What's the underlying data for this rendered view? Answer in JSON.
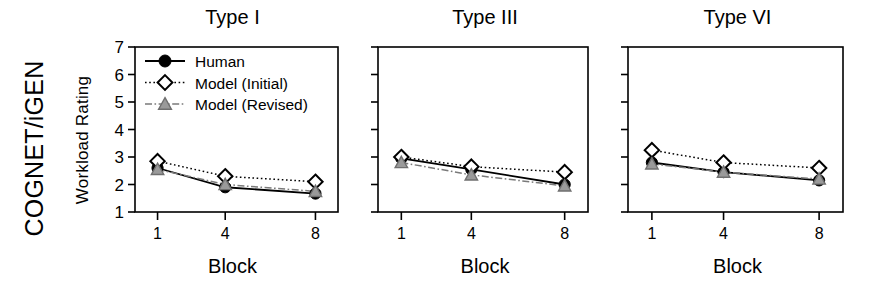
{
  "figure": {
    "group_label": "COGNET/iGEN",
    "y_axis_label": "Workload Rating",
    "x_axis_label": "Block"
  },
  "legend": {
    "position": "top-left of first panel",
    "entries": [
      {
        "label": "Human",
        "marker": "filled-circle-icon",
        "line": "solid",
        "color": "#000000",
        "fill": "#000000"
      },
      {
        "label": "Model (Initial)",
        "marker": "open-diamond-icon",
        "line": "dotted",
        "color": "#000000",
        "fill": "#ffffff"
      },
      {
        "label": "Model (Revised)",
        "marker": "gray-triangle-icon",
        "line": "dash-dot",
        "color": "#7a7a7a",
        "fill": "#9a9a9a"
      }
    ]
  },
  "chart_data": [
    {
      "type": "line",
      "title": "Type I",
      "xlabel": "Block",
      "ylabel": "Workload Rating",
      "x": [
        1,
        4,
        8
      ],
      "xtick_labels": [
        "1",
        "4",
        "8"
      ],
      "ytick_labels": [
        "1",
        "2",
        "3",
        "4",
        "5",
        "6",
        "7"
      ],
      "ylim": [
        1,
        7
      ],
      "xlim": [
        0,
        9
      ],
      "grid": false,
      "series": [
        {
          "name": "Human",
          "values": [
            2.6,
            1.9,
            1.67
          ]
        },
        {
          "name": "Model (Initial)",
          "values": [
            2.85,
            2.3,
            2.1
          ]
        },
        {
          "name": "Model (Revised)",
          "values": [
            2.55,
            2.0,
            1.75
          ]
        }
      ]
    },
    {
      "type": "line",
      "title": "Type III",
      "xlabel": "Block",
      "ylabel": "",
      "x": [
        1,
        4,
        8
      ],
      "xtick_labels": [
        "1",
        "4",
        "8"
      ],
      "ytick_labels": [
        "",
        "",
        "",
        "",
        "",
        "",
        ""
      ],
      "ylim": [
        1,
        7
      ],
      "xlim": [
        0,
        9
      ],
      "grid": false,
      "series": [
        {
          "name": "Human",
          "values": [
            2.95,
            2.55,
            2.0
          ]
        },
        {
          "name": "Model (Initial)",
          "values": [
            3.0,
            2.65,
            2.45
          ]
        },
        {
          "name": "Model (Revised)",
          "values": [
            2.8,
            2.35,
            1.95
          ]
        }
      ]
    },
    {
      "type": "line",
      "title": "Type VI",
      "xlabel": "Block",
      "ylabel": "",
      "x": [
        1,
        4,
        8
      ],
      "xtick_labels": [
        "1",
        "4",
        "8"
      ],
      "ytick_labels": [
        "",
        "",
        "",
        "",
        "",
        "",
        ""
      ],
      "ylim": [
        1,
        7
      ],
      "xlim": [
        0,
        9
      ],
      "grid": false,
      "series": [
        {
          "name": "Human",
          "values": [
            2.8,
            2.45,
            2.15
          ]
        },
        {
          "name": "Model (Initial)",
          "values": [
            3.25,
            2.8,
            2.6
          ]
        },
        {
          "name": "Model (Revised)",
          "values": [
            2.75,
            2.45,
            2.2
          ]
        }
      ]
    }
  ]
}
